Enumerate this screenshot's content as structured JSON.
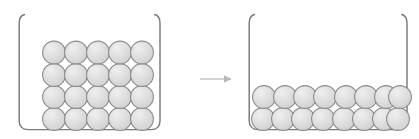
{
  "figure": {
    "type": "diagram",
    "background_color": "#ffffff",
    "arrow": {
      "icon": "right-arrow-icon",
      "x_start": 200,
      "x_end": 233,
      "y": 79,
      "color": "#b9b9b9",
      "label": ""
    },
    "beaker_style": {
      "wall_color": "#7a7a7a",
      "wall_width": 1.4,
      "lip_curve": "outward",
      "bottom_corner_radius": 9
    },
    "particle_style": {
      "fill": "#dcdcdc",
      "stroke": "#8c8c8c",
      "stroke_width": 1.1,
      "highlight": "#efefef",
      "shadow": "#b4b4b4"
    },
    "beakers": [
      {
        "name": "left-beaker",
        "label": "",
        "x_left": 19,
        "x_right": 160,
        "y_top": 14,
        "y_bottom": 130,
        "particle_count": 20,
        "rows": 4,
        "columns": 5,
        "packing": "square-grid",
        "particle_radius": 11.4,
        "fill_height_px": 92,
        "column_x": [
          54,
          76,
          98,
          120,
          142
        ],
        "row_y": [
          52,
          75,
          97,
          119
        ]
      },
      {
        "name": "right-beaker",
        "label": "",
        "x_left": 249,
        "x_right": 407,
        "y_top": 14,
        "y_bottom": 130,
        "particle_count": 16,
        "rows": 2,
        "columns": 8,
        "packing": "dense-offset",
        "particle_radius": 11.4,
        "fill_height_px": 45,
        "row_y": [
          97,
          119
        ],
        "top_row_x": [
          264,
          285,
          305,
          325,
          346,
          366,
          386,
          400
        ],
        "bottom_row_x": [
          263,
          283,
          303,
          323,
          344,
          364,
          384,
          398
        ]
      }
    ]
  }
}
